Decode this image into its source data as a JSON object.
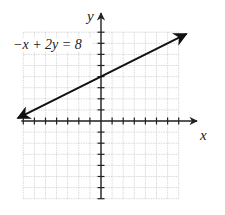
{
  "chart_data": {
    "type": "line",
    "title": "",
    "xlabel": "x",
    "ylabel": "y",
    "xlim": [
      -7,
      7
    ],
    "ylim": [
      -7,
      8
    ],
    "grid": true,
    "tick_step": 1,
    "tick_labels": false,
    "series": [
      {
        "name": "-x + 2y = 8",
        "equation": "-x + 2y = 8",
        "slope": 0.5,
        "y_intercept": 4,
        "x": [
          -7.5,
          7.7
        ],
        "y": [
          0.25,
          7.85
        ],
        "arrows": "both"
      }
    ],
    "annotations": [
      {
        "text": "−x + 2y = 8",
        "x": -7.4,
        "y": 7
      }
    ]
  },
  "labels": {
    "equation": "−x + 2y = 8",
    "x_axis": "x",
    "y_axis": "y"
  },
  "colors": {
    "grid": "#cfcfcf",
    "axis": "#222222",
    "line": "#111111"
  }
}
